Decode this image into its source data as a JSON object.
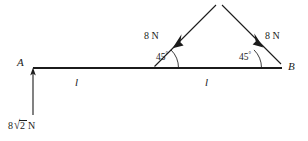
{
  "figure": {
    "stroke_color": "#1b1b1b",
    "background_color": "#ffffff",
    "points": [
      {
        "name": "A",
        "label": "A",
        "x": 33,
        "y": 68
      },
      {
        "name": "B",
        "label": "B",
        "x": 282,
        "y": 68
      }
    ],
    "segments": [
      {
        "name": "left-segment",
        "label": "l",
        "from": "A",
        "to": "mid",
        "mid_x": 78,
        "label_y": 84
      },
      {
        "name": "right-segment",
        "label": "l",
        "from": "mid",
        "to": "B",
        "mid_x": 208,
        "label_y": 84
      }
    ],
    "forces": [
      {
        "name": "force-at-a",
        "label": "8",
        "radicand": "2",
        "unit": "N",
        "magnitude": "8√2 N",
        "direction": "up",
        "tail_x": 33,
        "tail_y": 115,
        "head_x": 33,
        "head_y": 69,
        "label_x": 8,
        "label_y": 120
      },
      {
        "name": "force-left-45",
        "label": "8 N",
        "magnitude": "8 N",
        "direction": "down-left",
        "tail_x": 216,
        "tail_y": 5,
        "head_x": 176,
        "head_y": 45,
        "vertex_x": 153,
        "vertex_y": 68,
        "angle": "45",
        "label_x": 144,
        "label_y": 31
      },
      {
        "name": "force-right-45",
        "label": "8 N",
        "magnitude": "8 N",
        "direction": "down-right",
        "tail_x": 222,
        "tail_y": 5,
        "head_x": 262,
        "head_y": 45,
        "vertex_x": 236,
        "vertex_y": 68,
        "angle": "45",
        "label_x": 265,
        "label_y": 31
      }
    ],
    "angles": [
      {
        "name": "angle-left",
        "value": "45",
        "degree_symbol": "°",
        "x": 157,
        "y": 56
      },
      {
        "name": "angle-right",
        "value": "45",
        "degree_symbol": "°",
        "x": 240,
        "y": 56
      }
    ],
    "units": {
      "newton": "N"
    }
  }
}
